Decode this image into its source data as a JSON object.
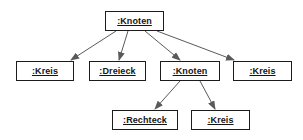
{
  "diagram": {
    "kind": "uml-object-diagram",
    "background_color": "#ffffff",
    "border_color": "#1c1c1c",
    "edge_color": "#5a5a5a",
    "text_color": "#151515",
    "nodes": [
      {
        "id": "n0",
        "label": ":Knoten",
        "x": 105,
        "y": 11,
        "w": 59,
        "h": 20
      },
      {
        "id": "n1",
        "label": ":Kreis",
        "x": 16,
        "y": 61,
        "w": 58,
        "h": 20
      },
      {
        "id": "n2",
        "label": ":Dreieck",
        "x": 89,
        "y": 61,
        "w": 57,
        "h": 20
      },
      {
        "id": "n3",
        "label": ":Knoten",
        "x": 160,
        "y": 61,
        "w": 60,
        "h": 20
      },
      {
        "id": "n4",
        "label": ":Kreis",
        "x": 233,
        "y": 61,
        "w": 59,
        "h": 20
      },
      {
        "id": "n5",
        "label": ":Rechteck",
        "x": 112,
        "y": 110,
        "w": 66,
        "h": 20
      },
      {
        "id": "n6",
        "label": ":Kreis",
        "x": 191,
        "y": 110,
        "w": 59,
        "h": 20
      }
    ],
    "edges": [
      {
        "from": "n0",
        "to": "n1",
        "x1": 116,
        "y1": 31,
        "x2": 71,
        "y2": 60
      },
      {
        "from": "n0",
        "to": "n2",
        "x1": 128,
        "y1": 31,
        "x2": 119,
        "y2": 60
      },
      {
        "from": "n0",
        "to": "n3",
        "x1": 145,
        "y1": 31,
        "x2": 180,
        "y2": 60
      },
      {
        "from": "n0",
        "to": "n4",
        "x1": 157,
        "y1": 31,
        "x2": 234,
        "y2": 60
      },
      {
        "from": "n3",
        "to": "n5",
        "x1": 180,
        "y1": 81,
        "x2": 155,
        "y2": 109
      },
      {
        "from": "n3",
        "to": "n6",
        "x1": 200,
        "y1": 81,
        "x2": 215,
        "y2": 109
      }
    ]
  }
}
